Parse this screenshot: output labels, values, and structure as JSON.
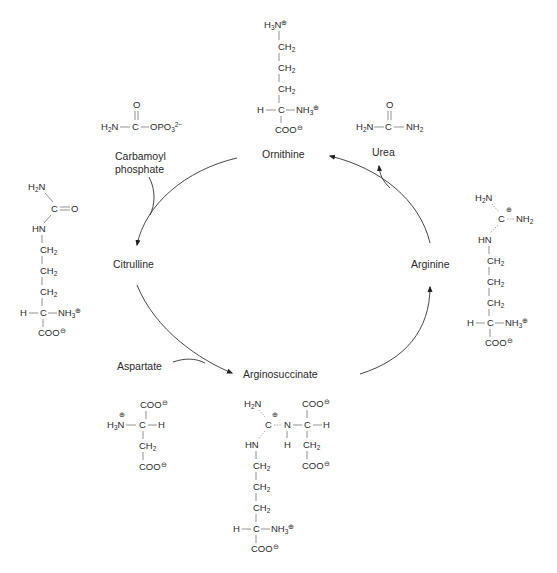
{
  "diagram": {
    "cycle_labels": {
      "ornithine": "Ornithine",
      "citrulline": "Citrulline",
      "arginosuccinate": "Arginosuccinate",
      "arginine": "Arginine"
    },
    "inputs": {
      "carbamoyl_phosphate_line1": "Carbamoyl",
      "carbamoyl_phosphate_line2": "phosphate",
      "aspartate": "Aspartate"
    },
    "outputs": {
      "urea": "Urea"
    },
    "structures": {
      "ornithine": [
        "H3N⊕",
        "CH2",
        "CH2",
        "CH2",
        "H—C—NH3⊕",
        "COO⊖"
      ],
      "carbamoyl_phosphate": [
        "O",
        "H2N—C—OPO3 2−"
      ],
      "urea": [
        "O",
        "H2N—C—NH2"
      ],
      "citrulline": [
        "H2N",
        "C═O",
        "HN",
        "CH2",
        "CH2",
        "CH2",
        "H—C—NH3⊕",
        "COO⊖"
      ],
      "arginine": [
        "H2N",
        "C⊕—NH2",
        "HN",
        "CH2",
        "CH2",
        "CH2",
        "H—C—NH3⊕",
        "COO⊖"
      ],
      "aspartate": [
        "COO⊖",
        "⊕H3N—C—H",
        "CH2",
        "COO⊖"
      ],
      "arginosuccinate": [
        "H2N",
        "COO⊖",
        "C⊕—N—C—H",
        "HN",
        "H",
        "CH2",
        "CH2",
        "COO⊖",
        "CH2",
        "CH2",
        "H—C—NH3⊕",
        "COO⊖"
      ]
    },
    "text": {
      "H": "H",
      "C": "C",
      "N": "N",
      "O": "O",
      "HN": "HN",
      "H2N_main": "H",
      "NH": "NH",
      "CH": "CH",
      "COO": "COO",
      "OPO": "OPO",
      "two": "2",
      "three": "3",
      "minus": "−",
      "plus_circ": "⊕",
      "minus_circ": "⊖"
    }
  }
}
